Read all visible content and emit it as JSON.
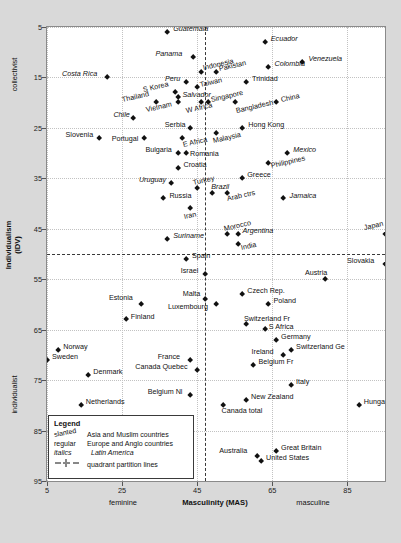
{
  "chart_data": {
    "type": "scatter",
    "title": "",
    "xlabel": "Masculinity (MAS)",
    "ylabel": "Individualism (IDV)",
    "xlim": [
      5,
      95
    ],
    "ylim": [
      5,
      95
    ],
    "y_inverted": true,
    "xticks": [
      5,
      25,
      45,
      65,
      85
    ],
    "yticks": [
      5,
      15,
      25,
      35,
      45,
      55,
      65,
      75,
      85,
      95
    ],
    "grid": true,
    "axis_side_labels": {
      "y_top": "collectivist",
      "y_bottom": "individualist",
      "x_left": "feminine",
      "x_right": "masculine"
    },
    "partition_lines": {
      "x": 47,
      "y": 50,
      "label": "quadrant partition lines"
    },
    "points": [
      {
        "label": "Guatemala",
        "x": 37,
        "y": 6,
        "style": "italics",
        "lx": 6,
        "ly": -3
      },
      {
        "label": "Ecuador",
        "x": 63,
        "y": 8,
        "style": "italics",
        "lx": 6,
        "ly": -3
      },
      {
        "label": "Panama",
        "x": 44,
        "y": 11,
        "style": "italics",
        "lx": -38,
        "ly": -3
      },
      {
        "label": "Venezuela",
        "x": 73,
        "y": 12,
        "style": "italics",
        "lx": 6,
        "ly": -3
      },
      {
        "label": "Costa Rica",
        "x": 21,
        "y": 15,
        "style": "italics",
        "lx": -45,
        "ly": -3
      },
      {
        "label": "Indonesia",
        "x": 46,
        "y": 14,
        "style": "slanted",
        "lx": 3,
        "ly": -4
      },
      {
        "label": "Pakistan",
        "x": 50,
        "y": 14,
        "style": "slanted",
        "lx": 4,
        "ly": -3
      },
      {
        "label": "Colombia",
        "x": 64,
        "y": 13,
        "style": "italics",
        "lx": 6,
        "ly": -3
      },
      {
        "label": "Peru",
        "x": 42,
        "y": 16,
        "style": "italics",
        "lx": -21,
        "ly": -3
      },
      {
        "label": "Taiwan",
        "x": 45,
        "y": 17,
        "style": "slanted",
        "lx": 4,
        "ly": -3
      },
      {
        "label": "Trinidad",
        "x": 58,
        "y": 16,
        "style": "regular",
        "lx": 6,
        "ly": -3
      },
      {
        "label": "S Korea",
        "x": 39,
        "y": 18,
        "style": "slanted",
        "lx": -31,
        "ly": -3
      },
      {
        "label": "Salvador",
        "x": 40,
        "y": 19,
        "style": "italics",
        "lx": 4,
        "ly": -3
      },
      {
        "label": "Singapore",
        "x": 48,
        "y": 20,
        "style": "slanted",
        "lx": 4,
        "ly": -3
      },
      {
        "label": "Thailand",
        "x": 34,
        "y": 20,
        "style": "slanted",
        "lx": -33,
        "ly": -3
      },
      {
        "label": "Vietnam",
        "x": 40,
        "y": 20,
        "style": "slanted",
        "lx": -31,
        "ly": 7
      },
      {
        "label": "W Africa",
        "x": 46,
        "y": 20,
        "style": "slanted",
        "lx": -14,
        "ly": 8
      },
      {
        "label": "Bangladesh",
        "x": 55,
        "y": 20,
        "style": "slanted",
        "lx": 2,
        "ly": 8
      },
      {
        "label": "China",
        "x": 66,
        "y": 20,
        "style": "slanted",
        "lx": 6,
        "ly": -3
      },
      {
        "label": "Chile",
        "x": 28,
        "y": 23,
        "style": "italics",
        "lx": -20,
        "ly": -3
      },
      {
        "label": "Malaysia",
        "x": 50,
        "y": 26,
        "style": "slanted",
        "lx": -2,
        "ly": 8
      },
      {
        "label": "Hong Kong",
        "x": 57,
        "y": 25,
        "style": "regular",
        "lx": 6,
        "ly": -3
      },
      {
        "label": "Serbia",
        "x": 43,
        "y": 25,
        "style": "regular",
        "lx": -25,
        "ly": -3
      },
      {
        "label": "Slovenia",
        "x": 19,
        "y": 27,
        "style": "regular",
        "lx": -34,
        "ly": -3
      },
      {
        "label": "Portugal",
        "x": 31,
        "y": 27,
        "style": "regular",
        "lx": -33,
        "ly": 1
      },
      {
        "label": "E Africa",
        "x": 41,
        "y": 27,
        "style": "slanted",
        "lx": 2,
        "ly": 7
      },
      {
        "label": "Bulgaria",
        "x": 40,
        "y": 30,
        "style": "regular",
        "lx": -33,
        "ly": -3
      },
      {
        "label": "Romania",
        "x": 42,
        "y": 30,
        "style": "regular",
        "lx": 4,
        "ly": 1
      },
      {
        "label": "Croatia",
        "x": 40,
        "y": 33,
        "style": "regular",
        "lx": 5,
        "ly": -3
      },
      {
        "label": "Uruguay",
        "x": 38,
        "y": 36,
        "style": "italics",
        "lx": -32,
        "ly": -3
      },
      {
        "label": "Turkey",
        "x": 45,
        "y": 37,
        "style": "slanted",
        "lx": -3,
        "ly": -5
      },
      {
        "label": "Greece",
        "x": 57,
        "y": 35,
        "style": "regular",
        "lx": 5,
        "ly": -3
      },
      {
        "label": "Mexico",
        "x": 69,
        "y": 30,
        "style": "italics",
        "lx": 6,
        "ly": -3
      },
      {
        "label": "Philippines",
        "x": 64,
        "y": 32,
        "style": "slanted",
        "lx": 3,
        "ly": 3
      },
      {
        "label": "Russia",
        "x": 36,
        "y": 39,
        "style": "regular",
        "lx": 6,
        "ly": -3
      },
      {
        "label": "Brazil",
        "x": 49,
        "y": 38,
        "style": "italics",
        "lx": -1,
        "ly": -6
      },
      {
        "label": "Arab ctrs",
        "x": 53,
        "y": 38,
        "style": "slanted",
        "lx": 1,
        "ly": 6
      },
      {
        "label": "Jamaica",
        "x": 68,
        "y": 39,
        "style": "italics",
        "lx": 6,
        "ly": -3
      },
      {
        "label": "Iran",
        "x": 43,
        "y": 41,
        "style": "slanted",
        "lx": -5,
        "ly": 8
      },
      {
        "label": "Morocco",
        "x": 53,
        "y": 46,
        "style": "slanted",
        "lx": -2,
        "ly": -5
      },
      {
        "label": "Argentina",
        "x": 56,
        "y": 46,
        "style": "italics",
        "lx": 4,
        "ly": -3
      },
      {
        "label": "India",
        "x": 56,
        "y": 48,
        "style": "slanted",
        "lx": 3,
        "ly": 4
      },
      {
        "label": "Suriname",
        "x": 37,
        "y": 47,
        "style": "italics",
        "lx": 6,
        "ly": -3
      },
      {
        "label": "Japan",
        "x": 95,
        "y": 46,
        "style": "slanted",
        "lx": -20,
        "ly": -6
      },
      {
        "label": "Spain",
        "x": 42,
        "y": 51,
        "style": "regular",
        "lx": 6,
        "ly": -3
      },
      {
        "label": "Slovakia",
        "x": 95,
        "y": 52,
        "style": "regular",
        "lx": -38,
        "ly": -3
      },
      {
        "label": "Israel",
        "x": 47,
        "y": 54,
        "style": "regular",
        "lx": -24,
        "ly": -3
      },
      {
        "label": "Austria",
        "x": 79,
        "y": 55,
        "style": "regular",
        "lx": -20,
        "ly": -6
      },
      {
        "label": "Malta",
        "x": 47,
        "y": 59,
        "style": "regular",
        "lx": -22,
        "ly": -5
      },
      {
        "label": "Estonia",
        "x": 30,
        "y": 60,
        "style": "regular",
        "lx": -32,
        "ly": -6
      },
      {
        "label": "Czech Rep.",
        "x": 57,
        "y": 58,
        "style": "regular",
        "lx": 5,
        "ly": -3
      },
      {
        "label": "Poland",
        "x": 64,
        "y": 60,
        "style": "regular",
        "lx": 5,
        "ly": -3
      },
      {
        "label": "Luxembourg",
        "x": 50,
        "y": 60,
        "style": "regular",
        "lx": -48,
        "ly": 3
      },
      {
        "label": "Finland",
        "x": 26,
        "y": 63,
        "style": "regular",
        "lx": 5,
        "ly": -3
      },
      {
        "label": "Switzerland Fr",
        "x": 58,
        "y": 64,
        "style": "regular",
        "lx": -2,
        "ly": -6
      },
      {
        "label": "S Africa",
        "x": 63,
        "y": 65,
        "style": "regular",
        "lx": 4,
        "ly": -3
      },
      {
        "label": "Germany",
        "x": 66,
        "y": 67,
        "style": "regular",
        "lx": 5,
        "ly": -3
      },
      {
        "label": "Switzerland Ge",
        "x": 70,
        "y": 69,
        "style": "regular",
        "lx": 5,
        "ly": -3
      },
      {
        "label": "Ireland",
        "x": 68,
        "y": 70,
        "style": "regular",
        "lx": -32,
        "ly": -3
      },
      {
        "label": "Norway",
        "x": 8,
        "y": 69,
        "style": "regular",
        "lx": 5,
        "ly": -3
      },
      {
        "label": "Sweden",
        "x": 5,
        "y": 71,
        "style": "regular",
        "lx": 5,
        "ly": -3
      },
      {
        "label": "France",
        "x": 43,
        "y": 71,
        "style": "regular",
        "lx": -32,
        "ly": -3
      },
      {
        "label": "Denmark",
        "x": 16,
        "y": 74,
        "style": "regular",
        "lx": 5,
        "ly": -3
      },
      {
        "label": "Canada Quebec",
        "x": 45,
        "y": 73,
        "style": "regular",
        "lx": -62,
        "ly": -3
      },
      {
        "label": "Belgium Fr",
        "x": 60,
        "y": 72,
        "style": "regular",
        "lx": 5,
        "ly": -3
      },
      {
        "label": "Italy",
        "x": 70,
        "y": 76,
        "style": "regular",
        "lx": 5,
        "ly": -3
      },
      {
        "label": "Belgium Nl",
        "x": 43,
        "y": 78,
        "style": "regular",
        "lx": -42,
        "ly": -3
      },
      {
        "label": "Netherlands",
        "x": 14,
        "y": 80,
        "style": "regular",
        "lx": 5,
        "ly": -3
      },
      {
        "label": "New Zealand",
        "x": 58,
        "y": 79,
        "style": "regular",
        "lx": 5,
        "ly": -3
      },
      {
        "label": "Hungary",
        "x": 88,
        "y": 80,
        "style": "regular",
        "lx": 5,
        "ly": -3
      },
      {
        "label": "Canada total",
        "x": 52,
        "y": 80,
        "style": "regular",
        "lx": -2,
        "ly": 6
      },
      {
        "label": "Australia",
        "x": 61,
        "y": 90,
        "style": "regular",
        "lx": -38,
        "ly": -5
      },
      {
        "label": "Great Britain",
        "x": 66,
        "y": 89,
        "style": "regular",
        "lx": 5,
        "ly": -3
      },
      {
        "label": "United States",
        "x": 62,
        "y": 91,
        "style": "regular",
        "lx": 5,
        "ly": -3
      }
    ]
  },
  "legend": {
    "title": "Legend",
    "rows": [
      {
        "key": "slanted",
        "key_style": "slanted",
        "desc": "Asia and Muslim countries",
        "desc_style": "regular"
      },
      {
        "key": "regular",
        "key_style": "regular",
        "desc": "Europe and Anglo countries",
        "desc_style": "regular"
      },
      {
        "key": "italics",
        "key_style": "italics",
        "desc": "Latin America",
        "desc_style": "italics"
      },
      {
        "key": "dash-line-icon",
        "key_style": "icon",
        "desc": "quadrant partition lines",
        "desc_style": "regular"
      }
    ]
  }
}
